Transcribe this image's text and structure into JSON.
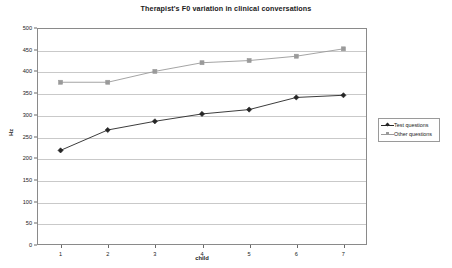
{
  "chart_data": {
    "type": "line",
    "title": "Therapist's F0 variation in clinical conversations",
    "xlabel": "child",
    "ylabel": "Hz",
    "categories": [
      "1",
      "2",
      "3",
      "4",
      "5",
      "6",
      "7"
    ],
    "x": [
      1,
      2,
      3,
      4,
      5,
      6,
      7
    ],
    "xlim": [
      0.5,
      7.5
    ],
    "ylim": [
      0,
      500
    ],
    "yticks": [
      0,
      50,
      100,
      150,
      200,
      250,
      300,
      350,
      400,
      450,
      500
    ],
    "grid": "horizontal",
    "legend_position": "right-outside",
    "series": [
      {
        "name": "Test questions",
        "values": [
          218,
          265,
          285,
          302,
          312,
          340,
          345
        ],
        "color": "#262626",
        "marker": "diamond",
        "marker_fill": "#262626"
      },
      {
        "name": "Other questions",
        "values": [
          375,
          375,
          400,
          420,
          425,
          435,
          452
        ],
        "color": "#9a9a9a",
        "marker": "square",
        "marker_fill": "#9a9a9a"
      }
    ]
  },
  "legend": {
    "entries": [
      {
        "label": "Test questions"
      },
      {
        "label": "Other questions"
      }
    ]
  }
}
